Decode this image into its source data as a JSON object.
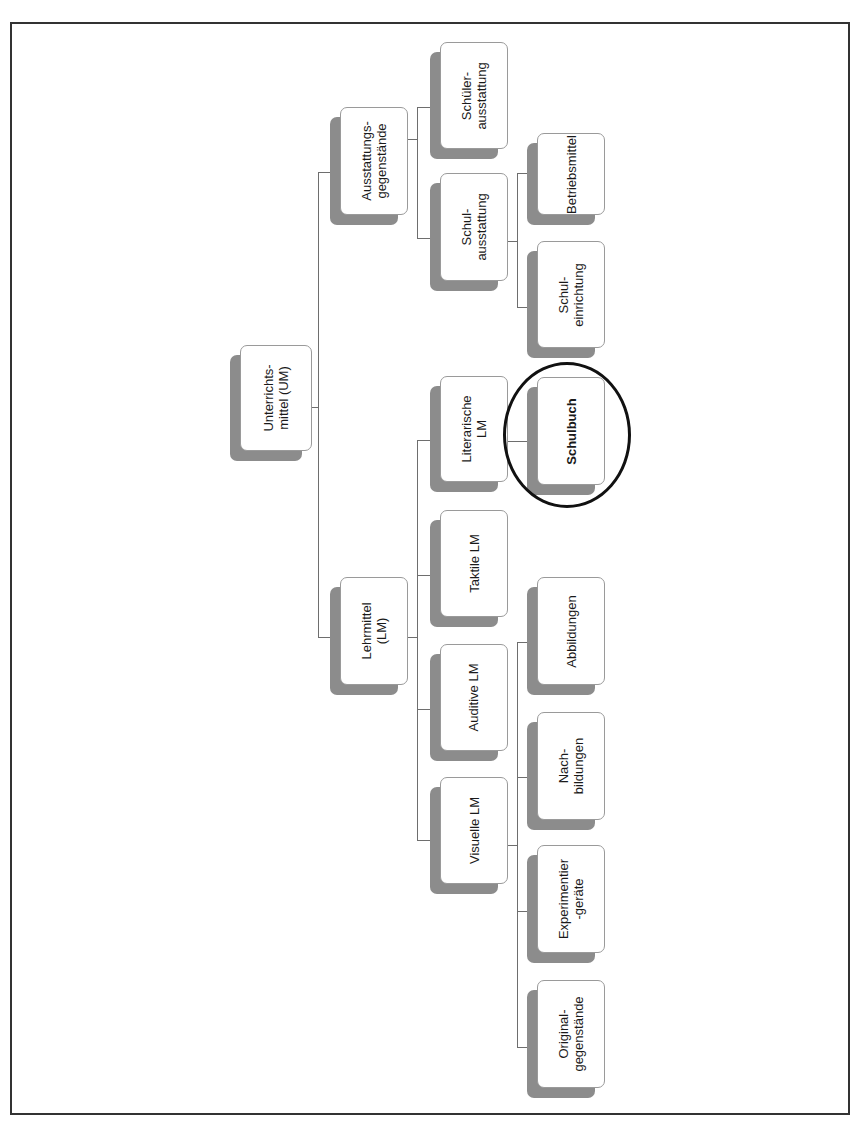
{
  "diagram": {
    "type": "tree",
    "orientation": "rotated-90-ccw",
    "root": {
      "label": "Unterrichts-\nmittel (UM)"
    },
    "level1": {
      "ausstattung": "Ausstattungs-\ngegenstände",
      "lehrmittel": "Lehrmittel\n(LM)"
    },
    "level2": {
      "schueler_ausstattung": "Schüler-\nausstattung",
      "schul_ausstattung": "Schul-\nausstattung",
      "literarische": "Literarische\nLM",
      "taktile": "Taktile LM",
      "auditive": "Auditive LM",
      "visuelle": "Visuelle LM"
    },
    "level3": {
      "betriebsmittel": "Betriebsmittel",
      "schul_einrichtung": "Schul-\neinrichtung",
      "schulbuch": "Schulbuch",
      "abbildungen": "Abbildungen",
      "nachbildungen": "Nach-\nbildungen",
      "experimentiergeraete": "Experimentier\n-geräte",
      "originalgegenstaende": "Original-\ngegenstände"
    },
    "highlighted_node": "Schulbuch",
    "tree": {
      "Unterrichtsmittel (UM)": {
        "Ausstattungsgegenstände": {
          "Schülerausstattung": {},
          "Schulausstattung": {
            "Betriebsmittel": {},
            "Schuleinrichtung": {}
          }
        },
        "Lehrmittel (LM)": {
          "Literarische LM": {
            "Schulbuch": {}
          },
          "Taktile LM": {},
          "Auditive LM": {},
          "Visuelle LM": {
            "Abbildungen": {},
            "Nachbildungen": {},
            "Experimentiergeräte": {},
            "Originalgegenstände": {}
          }
        }
      }
    },
    "colors": {
      "box_fill": "#ffffff",
      "box_border": "#9a9a9a",
      "shadow": "#8c8c8c",
      "connector": "#6e6e6e",
      "highlight_ring": "#111111",
      "frame": "#333333"
    }
  }
}
